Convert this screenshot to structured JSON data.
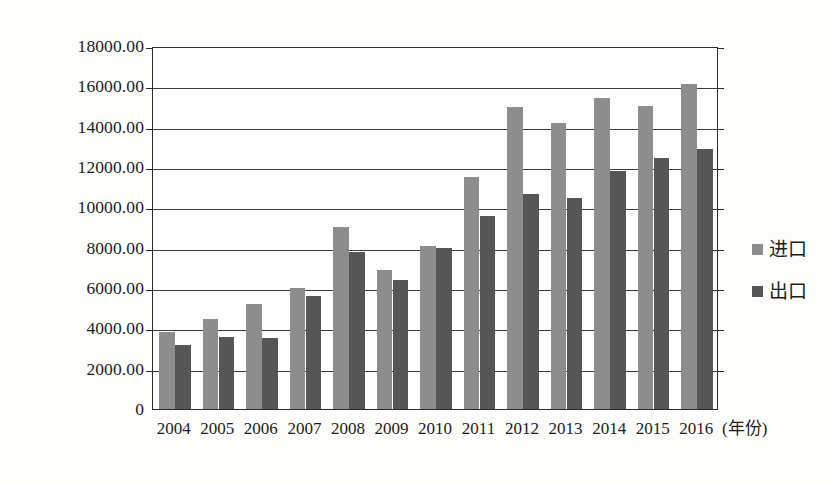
{
  "chart_data": {
    "type": "bar",
    "title": "",
    "subtitle": "",
    "xlabel": "(年份)",
    "ylabel": "",
    "categories": [
      "2004",
      "2005",
      "2006",
      "2007",
      "2008",
      "2009",
      "2010",
      "2011",
      "2012",
      "2013",
      "2014",
      "2015",
      "2016"
    ],
    "series": [
      {
        "name": "进口",
        "color": "#8d8d8d",
        "values": [
          3800,
          4450,
          5200,
          6000,
          9050,
          6900,
          8100,
          11500,
          15000,
          14200,
          15400,
          15050,
          16100
        ]
      },
      {
        "name": "出口",
        "color": "#565656",
        "values": [
          3150,
          3550,
          3500,
          5600,
          7800,
          6400,
          8000,
          9550,
          10650,
          10450,
          11800,
          12450,
          12900
        ]
      }
    ],
    "ylim": [
      0,
      18000
    ],
    "ytick_values": [
      0,
      2000,
      4000,
      6000,
      8000,
      10000,
      12000,
      14000,
      16000,
      18000
    ],
    "ytick_labels": [
      "0",
      "2000.00",
      "4000.00",
      "6000.00",
      "8000.00",
      "10000.00",
      "12000.00",
      "14000.00",
      "16000.00",
      "18000.00"
    ],
    "grid": true,
    "legend_position": "right",
    "legend": [
      {
        "label": "进口",
        "color": "#8d8d8d"
      },
      {
        "label": "出口",
        "color": "#565656"
      }
    ],
    "plot_border_color": "#2b2b2b",
    "background_color": "#ffffff"
  }
}
